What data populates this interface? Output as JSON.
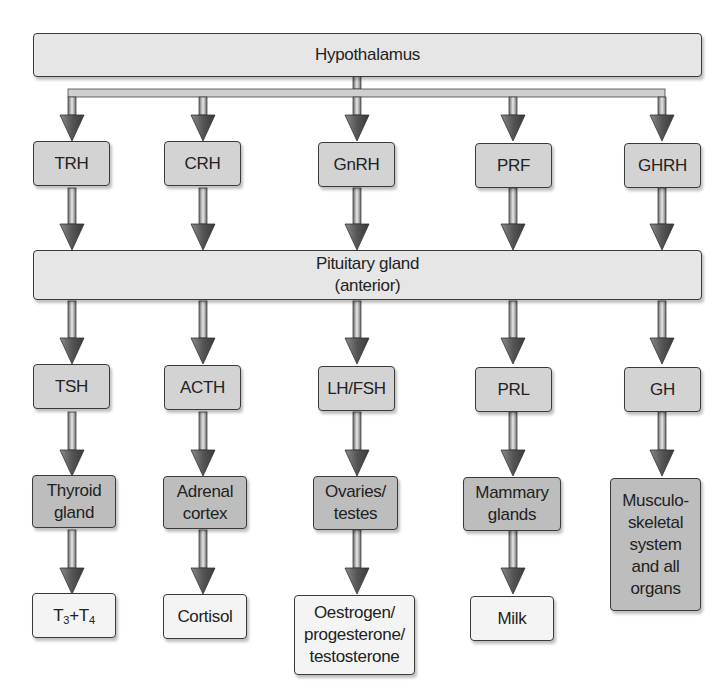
{
  "diagram": {
    "top": {
      "label": "Hypothalamus"
    },
    "hypothalamic_hormones": [
      {
        "label": "TRH"
      },
      {
        "label": "CRH"
      },
      {
        "label": "GnRH"
      },
      {
        "label": "PRF"
      },
      {
        "label": "GHRH"
      }
    ],
    "pituitary": {
      "line1": "Pituitary gland",
      "line2": "(anterior)"
    },
    "pituitary_hormones": [
      {
        "label": "TSH"
      },
      {
        "label": "ACTH"
      },
      {
        "label": "LH/FSH"
      },
      {
        "label": "PRL"
      },
      {
        "label": "GH"
      }
    ],
    "targets": [
      {
        "line1": "Thyroid",
        "line2": "gland"
      },
      {
        "line1": "Adrenal",
        "line2": "cortex"
      },
      {
        "line1": "Ovaries/",
        "line2": "testes"
      },
      {
        "line1": "Mammary",
        "line2": "glands"
      },
      {
        "line1": "Musculo-",
        "line2": "skeletal",
        "line3": "system",
        "line4": "and all",
        "line5": "organs"
      }
    ],
    "products": [
      {
        "t": "T",
        "s1": "3",
        "plus": "+",
        "t2": "T",
        "s2": "4"
      },
      {
        "line1": "Cortisol"
      },
      {
        "line1": "Oestrogen/",
        "line2": "progesterone/",
        "line3": "testosterone"
      },
      {
        "line1": "Milk"
      }
    ],
    "colors": {
      "box_light": "#e6e6e6",
      "box_mid": "#d3d3d3",
      "box_dark": "#bdbdbd",
      "arrow": "#5a5a5a",
      "border": "#3a3a3a"
    }
  }
}
